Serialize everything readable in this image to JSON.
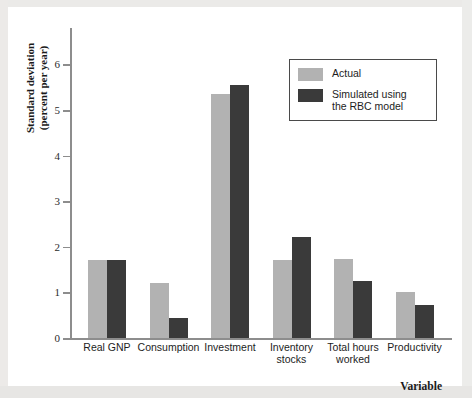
{
  "chart_data": {
    "type": "bar",
    "title": "",
    "xlabel": "Variable",
    "ylabel": "Standard deviation\n(percent per year)",
    "ylim": [
      0,
      6.8
    ],
    "yticks": [
      0,
      1,
      2,
      3,
      4,
      5,
      6
    ],
    "ytick_labels": [
      "0",
      "1",
      "2",
      "3",
      "4",
      "5",
      "6"
    ],
    "grid": false,
    "legend_position": "top-right",
    "categories": [
      "Real GNP",
      "Consumption",
      "Investment",
      "Inventory\nstocks",
      "Total hours\nworked",
      "Productivity"
    ],
    "series": [
      {
        "name": "Actual",
        "color": "#b2b2b2",
        "values": [
          1.72,
          1.21,
          5.35,
          1.72,
          1.73,
          1.02
        ]
      },
      {
        "name": "Simulated using\nthe RBC model",
        "color": "#3a3a3a",
        "values": [
          1.72,
          0.45,
          5.55,
          2.21,
          1.25,
          0.73
        ]
      }
    ]
  },
  "legend": {
    "items": [
      {
        "label": "Actual",
        "color": "#b2b2b2"
      },
      {
        "label": "Simulated using\nthe RBC model",
        "color": "#3a3a3a"
      }
    ]
  },
  "axes": {
    "y_title": "Standard deviation\n(percent per year)",
    "x_title": "Variable"
  }
}
